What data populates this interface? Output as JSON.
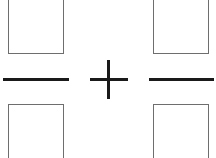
{
  "expression": {
    "operator": "+",
    "left_fraction": {
      "numerator": "",
      "denominator": ""
    },
    "right_fraction": {
      "numerator": "",
      "denominator": ""
    }
  },
  "colors": {
    "stroke": "#1a1a1a",
    "box_border": "#6e6e6e",
    "background": "#ffffff"
  }
}
